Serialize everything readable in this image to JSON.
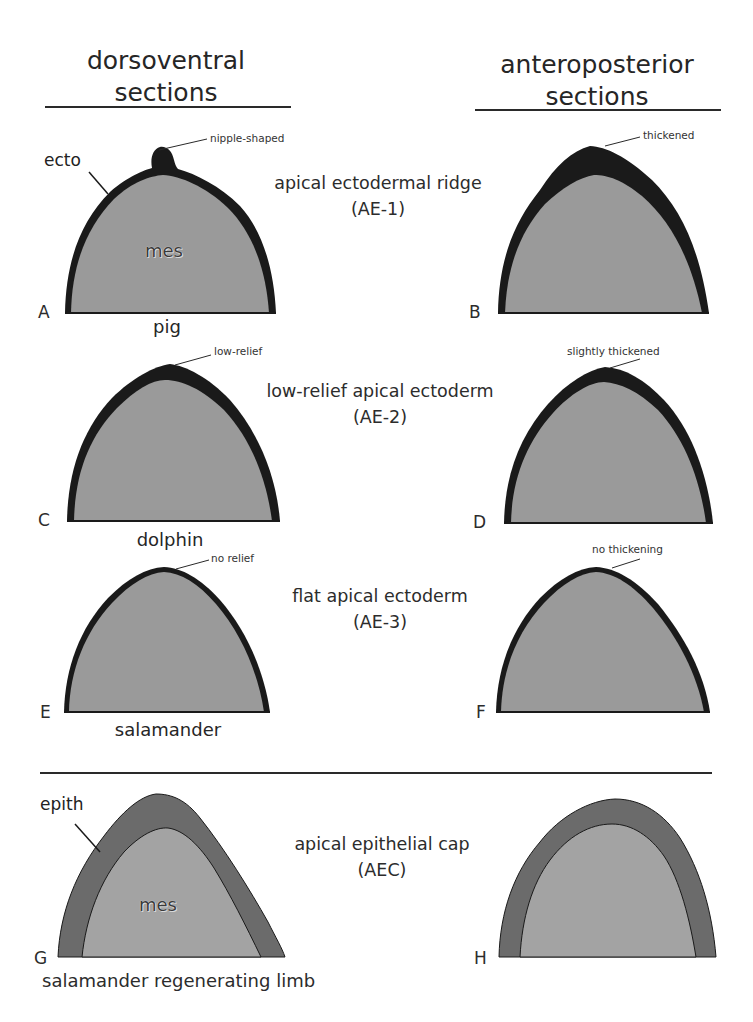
{
  "headers": {
    "left": {
      "line1": "dorsoventral",
      "line2": "sections"
    },
    "right": {
      "line1": "anteroposterior",
      "line2": "sections"
    }
  },
  "rows": [
    {
      "category": {
        "line1": "apical ectodermal ridge",
        "line2": "(AE-1)"
      },
      "left_panel": {
        "letter": "A",
        "species": "pig",
        "annotation": "nipple-shaped",
        "tissue_outer": "ecto",
        "tissue_inner": "mes"
      },
      "right_panel": {
        "letter": "B",
        "annotation": "thickened"
      }
    },
    {
      "category": {
        "line1": "low-relief apical ectoderm",
        "line2": "(AE-2)"
      },
      "left_panel": {
        "letter": "C",
        "species": "dolphin",
        "annotation": "low-relief"
      },
      "right_panel": {
        "letter": "D",
        "annotation": "slightly thickened"
      }
    },
    {
      "category": {
        "line1": "flat apical ectoderm",
        "line2": "(AE-3)"
      },
      "left_panel": {
        "letter": "E",
        "species": "salamander",
        "annotation": "no relief"
      },
      "right_panel": {
        "letter": "F",
        "annotation": "no thickening"
      }
    },
    {
      "category": {
        "line1": "apical epithelial cap",
        "line2": "(AEC)"
      },
      "left_panel": {
        "letter": "G",
        "species": "salamander regenerating limb",
        "tissue_outer": "epith",
        "tissue_inner": "mes"
      },
      "right_panel": {
        "letter": "H"
      }
    }
  ],
  "colors": {
    "ectoderm": "#1a1a1a",
    "mesenchyme": "#9a9a9a",
    "epithelial_cap": "#6b6b6b",
    "regen_mesenchyme": "#a3a3a3",
    "rule_line": "#2a2a2a"
  }
}
